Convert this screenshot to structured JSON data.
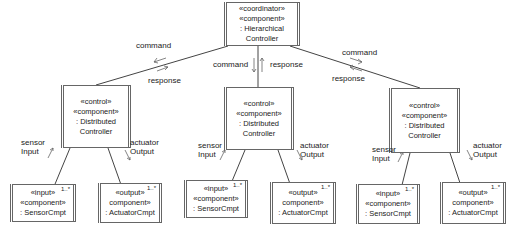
{
  "diagram": {
    "type": "UML component hierarchy",
    "coordinator": {
      "lines": [
        "«coordinator»",
        "«component»",
        ": Hierarchical",
        "Controller"
      ]
    },
    "controllers": [
      {
        "lines": [
          "«control»",
          "«component»",
          ": Distributed",
          "Controller"
        ],
        "uplink": {
          "command": "command",
          "response": "response"
        },
        "downlinks": {
          "sensor": [
            "sensor",
            "Input"
          ],
          "actuator": [
            "actuator",
            "Output"
          ]
        },
        "input_component": {
          "lines": [
            "«input»",
            "«component»",
            ": SensorCmpt"
          ],
          "multiplicity": "1..*"
        },
        "output_component": {
          "lines": [
            "«output»",
            "component»",
            ": ActuatorCmpt"
          ],
          "multiplicity": "1..*"
        }
      },
      {
        "lines": [
          "«control»",
          "«component»",
          ": Distributed",
          "Controller"
        ],
        "uplink": {
          "command": "command",
          "response": "response"
        },
        "downlinks": {
          "sensor": [
            "sensor",
            "Input"
          ],
          "actuator": [
            "actuator",
            "Output"
          ]
        },
        "input_component": {
          "lines": [
            "«input»",
            "«component»",
            ": SensorCmpt"
          ],
          "multiplicity": "1..*"
        },
        "output_component": {
          "lines": [
            "«output»",
            "component»",
            ": ActuatorCmpt"
          ],
          "multiplicity": "1..*"
        }
      },
      {
        "lines": [
          "«control»",
          "«component»",
          ": Distributed",
          "Controller"
        ],
        "uplink": {
          "command": "command",
          "response": "response"
        },
        "downlinks": {
          "sensor": [
            "sensor",
            "Input"
          ],
          "actuator": [
            "actuator",
            "Output"
          ]
        },
        "input_component": {
          "lines": [
            "«input»",
            "«component»",
            ": SensorCmpt"
          ],
          "multiplicity": "1..*"
        },
        "output_component": {
          "lines": [
            "«output»",
            "component»",
            ": ActuatorCmpt"
          ],
          "multiplicity": "1..*"
        }
      }
    ],
    "colors": {
      "line": "#444444",
      "border": "#666666",
      "text": "#222222",
      "background": "#ffffff"
    }
  }
}
